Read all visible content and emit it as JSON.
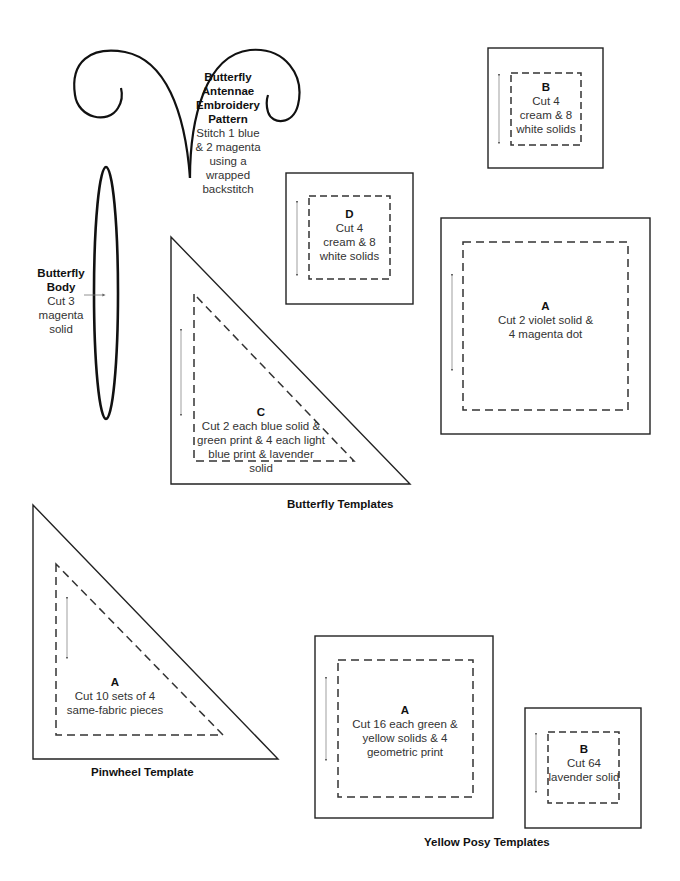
{
  "antennae": {
    "title_lines": [
      "Butterfly",
      "Antennae",
      "Embroidery",
      "Pattern"
    ],
    "instructions": [
      "Stitch 1 blue",
      "& 2 magenta",
      "using a",
      "wrapped",
      "backstitch"
    ]
  },
  "body": {
    "title_lines": [
      "Butterfly",
      "Body"
    ],
    "instructions": [
      "Cut 3",
      "magenta",
      "solid"
    ]
  },
  "butterfly": {
    "B": {
      "letter": "B",
      "lines": [
        "Cut 4",
        "cream & 8",
        "white solids"
      ]
    },
    "D": {
      "letter": "D",
      "lines": [
        "Cut 4",
        "cream & 8",
        "white solids"
      ]
    },
    "A": {
      "letter": "A",
      "lines": [
        "Cut 2 violet solid &",
        "4 magenta dot"
      ]
    },
    "C": {
      "letter": "C",
      "lines": [
        "Cut 2 each blue solid &",
        "green print & 4 each light",
        "blue print & lavender solid"
      ]
    },
    "caption": "Butterfly Templates"
  },
  "pinwheel": {
    "A": {
      "letter": "A",
      "lines": [
        "Cut 10 sets of 4",
        "same-fabric pieces"
      ]
    },
    "caption": "Pinwheel Template"
  },
  "yellow_posy": {
    "A": {
      "letter": "A",
      "lines": [
        "Cut 16 each green &",
        "yellow solids & 4",
        "geometric print"
      ]
    },
    "B": {
      "letter": "B",
      "lines": [
        "Cut 64",
        "lavender solid"
      ]
    },
    "caption": "Yellow Posy Templates"
  }
}
